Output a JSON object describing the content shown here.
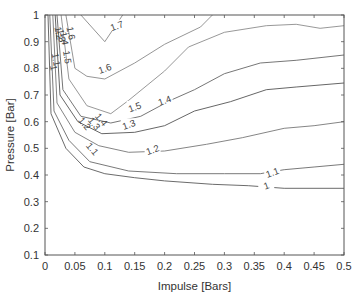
{
  "chart_data": {
    "type": "contour",
    "title": "",
    "xlabel": "Impulse [Bars]",
    "ylabel": "Pressure [Bar]",
    "xlim": [
      0,
      0.5
    ],
    "ylim": [
      0.1,
      1
    ],
    "grid": false,
    "legend": null,
    "xticks": [
      "0",
      "0.05",
      "0.1",
      "0.15",
      "0.2",
      "0.25",
      "0.3",
      "0.35",
      "0.4",
      "0.45",
      "0.5"
    ],
    "yticks": [
      "0.1",
      "0.2",
      "0.3",
      "0.4",
      "0.5",
      "0.6",
      "0.7",
      "0.8",
      "0.9",
      "1"
    ],
    "levels": [
      {
        "level": "1.7",
        "points": [
          [
            0.06,
            1.0
          ],
          [
            0.1,
            0.9
          ],
          [
            0.13,
            1.0
          ]
        ],
        "label_pos": [
          0.12,
          0.96
        ]
      },
      {
        "level": "1.6",
        "points": [
          [
            0.035,
            1.0
          ],
          [
            0.05,
            0.8
          ],
          [
            0.07,
            0.77
          ],
          [
            0.1,
            0.76
          ],
          [
            0.15,
            0.82
          ],
          [
            0.2,
            0.89
          ],
          [
            0.26,
            0.955
          ],
          [
            0.28,
            1.0
          ]
        ],
        "label_pos": [
          0.1,
          0.8
        ]
      },
      {
        "level": "1.5",
        "points": [
          [
            0.027,
            1.0
          ],
          [
            0.04,
            0.76
          ],
          [
            0.07,
            0.66
          ],
          [
            0.11,
            0.63
          ],
          [
            0.14,
            0.68
          ],
          [
            0.2,
            0.79
          ],
          [
            0.24,
            0.88
          ],
          [
            0.3,
            0.935
          ],
          [
            0.37,
            0.96
          ],
          [
            0.42,
            0.965
          ],
          [
            0.46,
            0.95
          ],
          [
            0.5,
            0.96
          ]
        ],
        "label_pos": [
          0.15,
          0.655
        ]
      },
      {
        "level": "1.4",
        "points": [
          [
            0.02,
            1.0
          ],
          [
            0.03,
            0.72
          ],
          [
            0.06,
            0.62
          ],
          [
            0.11,
            0.595
          ],
          [
            0.16,
            0.62
          ],
          [
            0.21,
            0.68
          ],
          [
            0.25,
            0.72
          ],
          [
            0.3,
            0.78
          ],
          [
            0.36,
            0.82
          ],
          [
            0.42,
            0.83
          ],
          [
            0.5,
            0.85
          ]
        ],
        "label_pos": [
          0.2,
          0.68
        ]
      },
      {
        "level": "1.3",
        "points": [
          [
            0.017,
            1.0
          ],
          [
            0.025,
            0.7
          ],
          [
            0.055,
            0.6
          ],
          [
            0.095,
            0.555
          ],
          [
            0.15,
            0.56
          ],
          [
            0.2,
            0.585
          ],
          [
            0.25,
            0.64
          ],
          [
            0.31,
            0.675
          ],
          [
            0.37,
            0.72
          ],
          [
            0.42,
            0.73
          ],
          [
            0.5,
            0.745
          ]
        ],
        "label_pos": [
          0.14,
          0.59
        ]
      },
      {
        "level": "1.2",
        "points": [
          [
            0.013,
            1.0
          ],
          [
            0.02,
            0.67
          ],
          [
            0.05,
            0.56
          ],
          [
            0.09,
            0.51
          ],
          [
            0.14,
            0.485
          ],
          [
            0.2,
            0.49
          ],
          [
            0.27,
            0.515
          ],
          [
            0.33,
            0.54
          ],
          [
            0.4,
            0.575
          ],
          [
            0.45,
            0.585
          ],
          [
            0.5,
            0.6
          ]
        ],
        "label_pos": [
          0.18,
          0.495
        ]
      },
      {
        "level": "1.1",
        "points": [
          [
            0.008,
            1.0
          ],
          [
            0.015,
            0.64
          ],
          [
            0.04,
            0.53
          ],
          [
            0.075,
            0.45
          ],
          [
            0.14,
            0.415
          ],
          [
            0.22,
            0.405
          ],
          [
            0.3,
            0.405
          ],
          [
            0.36,
            0.405
          ],
          [
            0.4,
            0.42
          ],
          [
            0.45,
            0.43
          ],
          [
            0.5,
            0.44
          ]
        ],
        "label_pos": [
          0.38,
          0.41
        ]
      },
      {
        "level": "1",
        "points": [
          [
            0.005,
            1.0
          ],
          [
            0.01,
            0.63
          ],
          [
            0.035,
            0.5
          ],
          [
            0.065,
            0.43
          ],
          [
            0.1,
            0.405
          ],
          [
            0.15,
            0.39
          ],
          [
            0.2,
            0.378
          ],
          [
            0.28,
            0.365
          ],
          [
            0.34,
            0.36
          ],
          [
            0.4,
            0.35
          ],
          [
            0.5,
            0.35
          ]
        ],
        "label_pos": [
          0.37,
          0.36
        ]
      }
    ],
    "inline_labels": [
      "1.7",
      "1.6",
      "1.6",
      "1.5",
      "1.5",
      "1.5",
      "1.4",
      "1.4",
      "1.4",
      "1.3",
      "1.3",
      "1.3",
      "1.2",
      "1.2",
      "1.2",
      "1.1",
      "1.1",
      "1.1",
      "1",
      "1",
      "1"
    ]
  }
}
